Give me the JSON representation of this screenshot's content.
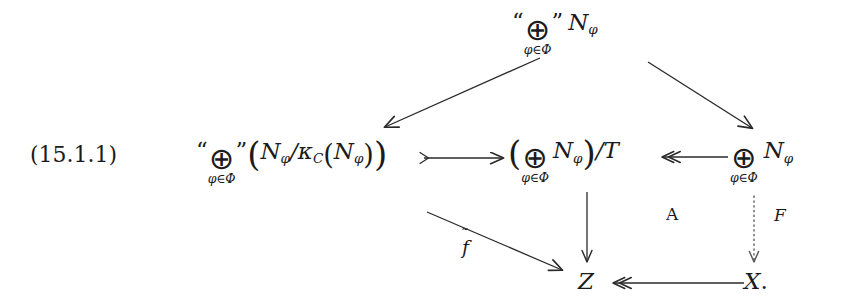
{
  "figure": {
    "equation_number": "(15.1.1)"
  },
  "nodes": {
    "top": {
      "id": "top-direct-sum-N-phi",
      "parts": {
        "open_quote": "“",
        "operator": "⊕",
        "limits": "φ∈Φ",
        "close_quote": "”",
        "object": "N",
        "object_sub": "φ"
      },
      "plain": "“⊕”_{φ∈Φ} N_φ"
    },
    "left": {
      "id": "left-direct-sum-quotient",
      "parts": {
        "open_quote": "“",
        "operator": "⊕",
        "limits": "φ∈Φ",
        "close_quote": "”",
        "lparen": "(",
        "numerator": "N",
        "numerator_sub": "φ",
        "slash": "/",
        "kappa": "κ",
        "kappa_sub": "C",
        "inner_lparen": "(",
        "inner_object": "N",
        "inner_object_sub": "φ",
        "inner_rparen": ")",
        "rparen": ")"
      },
      "plain": "“⊕”_{φ∈Φ}(N_φ/κ_C(N_φ))"
    },
    "middle": {
      "id": "middle-direct-sum-mod-T",
      "parts": {
        "lparen": "(",
        "operator": "⊕",
        "limits": "φ∈Φ",
        "object": "N",
        "object_sub": "φ",
        "rparen": ")",
        "slash": "/",
        "quotient_by": "T"
      },
      "plain": "(⊕_{φ∈Φ} N_φ)/T"
    },
    "right": {
      "id": "right-direct-sum-N-phi",
      "parts": {
        "operator": "⊕",
        "limits": "φ∈Φ",
        "object": "N",
        "object_sub": "φ"
      },
      "plain": "⊕_{φ∈Φ} N_φ"
    },
    "bottom_left": {
      "id": "object-Z",
      "label": "Z"
    },
    "bottom_right": {
      "id": "object-X",
      "label": "X",
      "trailing_punctuation": "."
    }
  },
  "edge_labels": {
    "f_tilde": "f",
    "f_tilde_accent": "˜",
    "region_A": "A",
    "functor_F": "F"
  },
  "edges": [
    {
      "id": "top-to-left",
      "from": "top",
      "to": "left",
      "style": "solid",
      "head": "single",
      "tail": "none"
    },
    {
      "id": "top-to-right",
      "from": "top",
      "to": "right",
      "style": "solid",
      "head": "single",
      "tail": "none"
    },
    {
      "id": "left-to-middle",
      "from": "left",
      "to": "middle",
      "style": "solid",
      "head": "single",
      "tail": "mono"
    },
    {
      "id": "right-to-middle",
      "from": "right",
      "to": "middle",
      "style": "solid",
      "head": "double-epi",
      "tail": "none"
    },
    {
      "id": "middle-to-Z",
      "from": "middle",
      "to": "bottom_left",
      "style": "solid",
      "head": "single",
      "tail": "none"
    },
    {
      "id": "left-to-Z",
      "from": "left",
      "to": "bottom_left",
      "style": "solid",
      "head": "single",
      "tail": "none",
      "label": "f_tilde"
    },
    {
      "id": "right-to-X",
      "from": "right",
      "to": "bottom_right",
      "style": "dotted",
      "head": "single",
      "tail": "none",
      "label": "functor_F"
    },
    {
      "id": "X-to-Z",
      "from": "bottom_right",
      "to": "bottom_left",
      "style": "solid",
      "head": "double-epi",
      "tail": "none"
    }
  ],
  "colors": {
    "background": "#ffffff",
    "ink": "#1b1b1b",
    "edge": "#2a2a2a"
  }
}
